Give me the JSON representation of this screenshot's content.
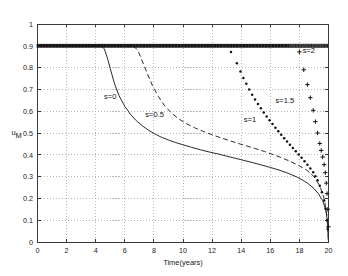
{
  "chart_data": {
    "type": "line",
    "title": "",
    "xlabel": "Time(years)",
    "ylabel": "u_M",
    "xlim": [
      0,
      20
    ],
    "ylim": [
      0,
      1
    ],
    "grid": true,
    "legend_position": "inline-annotations",
    "xticks": [
      0,
      2,
      4,
      6,
      8,
      10,
      12,
      14,
      16,
      18,
      20
    ],
    "xticklabels": [
      "0",
      "2",
      "4",
      "6",
      "8",
      "10",
      "12",
      "14",
      "16",
      "18",
      "20"
    ],
    "yticks": [
      0,
      0.1,
      0.2,
      0.3,
      0.4,
      0.5,
      0.6,
      0.7,
      0.8,
      0.9,
      1
    ],
    "yticklabels": [
      "0",
      "0.1",
      "0.2",
      "0.3",
      "0.4",
      "0.5",
      "0.6",
      "0.7",
      "0.8",
      "0.9",
      "1"
    ],
    "annotations": [
      {
        "text": "s=0",
        "x": 5.0,
        "y": 0.655
      },
      {
        "text": "s=0.5",
        "x": 8.05,
        "y": 0.575
      },
      {
        "text": "s=1",
        "x": 14.6,
        "y": 0.552
      },
      {
        "text": "s=1.5",
        "x": 17.0,
        "y": 0.637
      },
      {
        "text": "s=2",
        "x": 18.65,
        "y": 0.868
      }
    ],
    "series": [
      {
        "name": "s=0",
        "style": "solid",
        "marker": "none",
        "color": "#2b2b2b",
        "x": [
          0,
          1,
          2,
          3,
          4,
          4.4,
          4.6,
          4.8,
          5.0,
          5.3,
          5.6,
          6.0,
          6.4,
          6.8,
          7.2,
          7.6,
          8.0,
          8.5,
          9.0,
          9.5,
          10.0,
          10.6,
          11.2,
          11.8,
          12.4,
          13.0,
          13.6,
          14.2,
          14.8,
          15.4,
          16.0,
          16.6,
          17.2,
          17.8,
          18.2,
          18.6,
          19.0,
          19.3,
          19.6,
          19.8,
          19.9,
          20.0
        ],
        "y": [
          0.9,
          0.9,
          0.9,
          0.9,
          0.9,
          0.9,
          0.885,
          0.845,
          0.795,
          0.725,
          0.672,
          0.622,
          0.585,
          0.556,
          0.533,
          0.514,
          0.498,
          0.481,
          0.468,
          0.456,
          0.446,
          0.434,
          0.423,
          0.413,
          0.404,
          0.394,
          0.384,
          0.374,
          0.364,
          0.353,
          0.342,
          0.33,
          0.316,
          0.299,
          0.285,
          0.268,
          0.245,
          0.222,
          0.19,
          0.15,
          0.11,
          0.0
        ]
      },
      {
        "name": "s=0.5",
        "style": "dashed",
        "marker": "none",
        "color": "#2b2b2b",
        "x": [
          0,
          2,
          4,
          6,
          6.6,
          6.9,
          7.2,
          7.5,
          7.9,
          8.3,
          8.7,
          9.2,
          9.7,
          10.2,
          10.8,
          11.4,
          12.0,
          12.6,
          13.2,
          13.8,
          14.4,
          15.0,
          15.6,
          16.2,
          16.8,
          17.4,
          18.0,
          18.5,
          19.0,
          19.4,
          19.7,
          19.9,
          20.0
        ],
        "y": [
          0.9,
          0.9,
          0.9,
          0.9,
          0.9,
          0.878,
          0.83,
          0.78,
          0.718,
          0.668,
          0.628,
          0.592,
          0.565,
          0.544,
          0.524,
          0.507,
          0.492,
          0.478,
          0.465,
          0.452,
          0.44,
          0.428,
          0.415,
          0.401,
          0.386,
          0.369,
          0.349,
          0.33,
          0.3,
          0.258,
          0.2,
          0.12,
          0.0
        ]
      },
      {
        "name": "s=1",
        "style": "none",
        "marker": "dot",
        "color": "#141414",
        "x": [
          13.3,
          13.7,
          13.95,
          14.15,
          14.35,
          14.55,
          14.75,
          14.95,
          15.15,
          15.35,
          15.55,
          15.75,
          15.95,
          16.15,
          16.35,
          16.55,
          16.75,
          16.95,
          17.15,
          17.35,
          17.55,
          17.75,
          17.95,
          18.15,
          18.35,
          18.55,
          18.75,
          18.95,
          19.1,
          19.25,
          19.4,
          19.55,
          19.7,
          19.8,
          19.9,
          19.95
        ],
        "y": [
          0.872,
          0.82,
          0.782,
          0.752,
          0.726,
          0.7,
          0.676,
          0.654,
          0.633,
          0.613,
          0.594,
          0.576,
          0.558,
          0.541,
          0.524,
          0.508,
          0.492,
          0.476,
          0.461,
          0.446,
          0.431,
          0.416,
          0.401,
          0.386,
          0.37,
          0.354,
          0.337,
          0.32,
          0.302,
          0.283,
          0.258,
          0.228,
          0.19,
          0.152,
          0.1,
          0.06
        ]
      },
      {
        "name": "s=1.5",
        "style": "none",
        "marker": "plus",
        "color": "#141414",
        "x": [
          18.0,
          18.3,
          18.55,
          18.75,
          18.95,
          19.1,
          19.25,
          19.4,
          19.5,
          19.6,
          19.7,
          19.78,
          19.85,
          19.9,
          19.95,
          20.0
        ],
        "y": [
          0.872,
          0.79,
          0.722,
          0.662,
          0.604,
          0.552,
          0.5,
          0.452,
          0.42,
          0.39,
          0.355,
          0.318,
          0.27,
          0.222,
          0.15,
          0.07
        ]
      },
      {
        "name": "s=2",
        "style": "none",
        "marker": "dot-dense",
        "color": "#141414",
        "x": [
          0,
          20
        ],
        "y": [
          0.9,
          0.9
        ],
        "note": "dense marker line held at 0.9 across full time range"
      }
    ]
  },
  "axes": {
    "ylabel_base": "u",
    "ylabel_sub": "M"
  }
}
